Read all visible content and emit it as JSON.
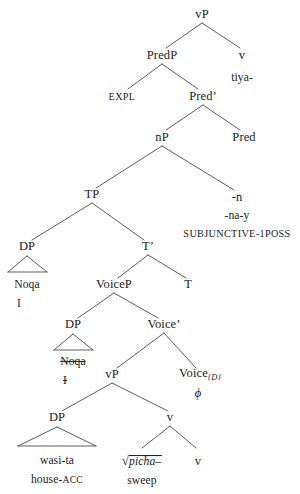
{
  "diagram": {
    "type": "syntax-tree",
    "line_color": "#4a4a4a",
    "text_color": "#1a1a1a",
    "background": "#ffffff",
    "nodes": {
      "vp_top": "vP",
      "predp": "PredP",
      "v_top": "v",
      "v_top_form": "tiya-",
      "expl": "EXPL",
      "pred_bar": "Pred’",
      "np": "nP",
      "pred": "Pred",
      "pred_affix_1": "-n",
      "pred_affix_2": "-na-y",
      "pred_gloss": "SUBJUNCTIVE-1POSS",
      "tp": "TP",
      "dp_subject": "DP",
      "t_bar": "T’",
      "dp_subject_form": "Noqa",
      "dp_subject_gloss": "I",
      "voicep": "VoiceP",
      "t": "T",
      "dp_trace": "DP",
      "voice_bar": "Voice’",
      "dp_trace_form": "Noqa",
      "dp_trace_gloss": "I",
      "vp_low": "vP",
      "voice_head": "Voice",
      "voice_head_subscript": "{D}",
      "voice_head_form": "ϕ",
      "dp_object": "DP",
      "v_low": "v",
      "dp_object_form": "wasi-ta",
      "dp_object_gloss_stem": "house-",
      "dp_object_gloss_sc": "ACC",
      "root_mark": "√",
      "root_form": "picha–",
      "root_gloss": "sweep",
      "v_terminal": "v"
    }
  }
}
